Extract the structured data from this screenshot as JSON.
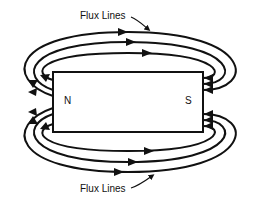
{
  "diagram": {
    "labels": {
      "top_label": "Flux Lines",
      "bottom_label": "Flux Lines",
      "north_pole": "N",
      "south_pole": "S"
    },
    "magnet": {
      "x": 53,
      "y": 72,
      "width": 150,
      "height": 60
    },
    "flux_line_count_top": 3,
    "flux_line_count_bottom": 3,
    "flow_direction": "out of N, into S (left arrows on N side, arrows pointing into S side)",
    "colors": {
      "stroke": "#111111",
      "background": "#ffffff"
    }
  }
}
